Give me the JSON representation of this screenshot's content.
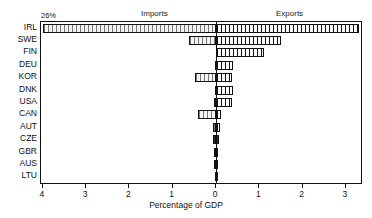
{
  "headers": {
    "imports": "Imports",
    "exports": "Exports"
  },
  "annotation": {
    "break_label": "26%",
    "break_icon": "axis-break-icon"
  },
  "axis": {
    "x_title": "Percentage of GDP",
    "x_ticks": [
      "4",
      "3",
      "2",
      "1",
      "0",
      "1",
      "2",
      "3"
    ],
    "x_tick_values": [
      -4,
      -3,
      -2,
      -1,
      0,
      1,
      2,
      3
    ],
    "x_min": -4,
    "x_max": 3.3
  },
  "chart_data": {
    "type": "bar",
    "orientation": "horizontal",
    "title": "",
    "subtitle": "",
    "xlabel": "Percentage of GDP",
    "ylabel": "",
    "xlim": [
      -4,
      3.3
    ],
    "grid": false,
    "legend_position": "top",
    "note": "Diverging horizontal bar chart. Imports plotted to the left of zero (negative direction), Exports to the right. IRL imports bar is truncated with an axis break and annotated 26%.",
    "categories": [
      "IRL",
      "SWE",
      "FIN",
      "DEU",
      "KOR",
      "DNK",
      "USA",
      "CAN",
      "AUT",
      "CZE",
      "GBR",
      "AUS",
      "LTU"
    ],
    "series": [
      {
        "name": "Imports",
        "pattern": "light-hatched",
        "values": [
          26.0,
          0.63,
          0.0,
          0.03,
          0.49,
          0.02,
          0.05,
          0.42,
          0.08,
          0.06,
          0.05,
          0.05,
          0.03
        ]
      },
      {
        "name": "Exports",
        "pattern": "vertical-hatched",
        "values": [
          3.3,
          1.5,
          1.1,
          0.4,
          0.38,
          0.4,
          0.38,
          0.12,
          0.1,
          0.07,
          0.05,
          0.05,
          0.05
        ]
      }
    ],
    "truncated_bars": [
      {
        "category": "IRL",
        "series": "Imports",
        "actual_value": 26.0,
        "label": "26%"
      }
    ]
  },
  "colors": {
    "axis": "#111111",
    "bar_outline": "#111111",
    "import_fill": "#f4f4f4",
    "export_fill": "#ffffff",
    "background": "#ffffff"
  }
}
